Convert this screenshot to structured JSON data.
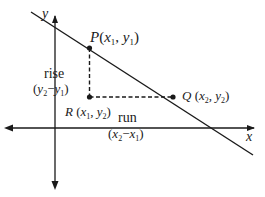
{
  "diagram": {
    "type": "slope-of-a-line",
    "axes": {
      "x_label": "x",
      "y_label": "y"
    },
    "points": {
      "P": {
        "name": "P",
        "coords_label": "(x1, y1)"
      },
      "Q": {
        "name": "Q",
        "coords_label": "(x2, y2)"
      },
      "R": {
        "name": "R",
        "coords_label": "(x1, y2)"
      }
    },
    "annotations": {
      "rise_word": "rise",
      "rise_expr": "(y2 − y1)",
      "run_word": "run",
      "run_expr": "(x2 − x1)"
    },
    "colors": {
      "ink": "#1a1a1a",
      "background": "#ffffff"
    }
  }
}
